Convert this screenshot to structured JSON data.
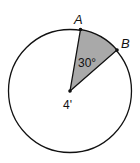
{
  "diagram": {
    "type": "circle-sector",
    "points": {
      "A": {
        "label": "A"
      },
      "B": {
        "label": "B"
      },
      "center": {
        "label": "4'"
      }
    },
    "angle_label": "30°",
    "radius_label": "4'",
    "colors": {
      "sector_fill": "#a9a9a9",
      "stroke": "#111111",
      "background": "#ffffff"
    }
  }
}
